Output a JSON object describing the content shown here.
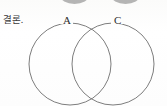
{
  "page": {
    "width": 167,
    "height": 106,
    "background_color": "#fdfdfc"
  },
  "conclusion": {
    "label": "결론."
  },
  "diagram": {
    "kind": "venn-diagram",
    "stroke_color": "#6e6e6e",
    "sets": [
      {
        "id": "a",
        "label": "A",
        "cx": 70,
        "cy": 64,
        "r": 41
      },
      {
        "id": "c",
        "label": "C",
        "cx": 113,
        "cy": 64,
        "r": 41
      }
    ]
  },
  "top_stubs": [
    {
      "id": "left",
      "color": "#9a9a9a"
    },
    {
      "id": "right",
      "color": "#9a9a9a"
    }
  ]
}
